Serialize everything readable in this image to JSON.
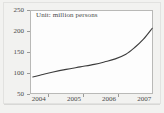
{
  "figure": {
    "background_color": "#f2f2f0",
    "plot_background_color": "#fdfdfd",
    "frame_color": "#b9b9b7",
    "line_color": "#3c3c3c",
    "text_color": "#4a4a4a"
  },
  "annotation": {
    "unit_note": "Unit: million persons"
  },
  "chart_data": {
    "type": "line",
    "title": "",
    "subtitle": "",
    "annotations": [
      "Unit: million persons"
    ],
    "xlabel": "",
    "ylabel": "",
    "unit": "million persons",
    "grid": false,
    "legend": false,
    "legend_position": "none",
    "xlim": [
      2004.0,
      2007.5
    ],
    "ylim": [
      50,
      250
    ],
    "y_ticks": [
      50,
      100,
      150,
      200,
      250
    ],
    "y_tick_labels": [
      "50",
      "100",
      "150",
      "200",
      "250"
    ],
    "x_ticks": [
      2004,
      2005,
      2006,
      2007
    ],
    "x_tick_labels": [
      "2004",
      "2005",
      "2006",
      "2007"
    ],
    "x_minor_ticks": [
      2004.5,
      2005.5,
      2006.5,
      2007.5
    ],
    "series": [
      {
        "name": "value",
        "x": [
          2004.05,
          2004.3,
          2004.6,
          2005.0,
          2005.4,
          2005.8,
          2006.1,
          2006.4,
          2006.7,
          2006.95,
          2007.2,
          2007.45
        ],
        "values": [
          93,
          98,
          104,
          111,
          117,
          123,
          129,
          136,
          147,
          163,
          183,
          209
        ]
      }
    ]
  }
}
